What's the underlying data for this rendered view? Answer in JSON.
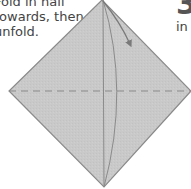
{
  "instructions": {
    "lines": [
      "Fold in half",
      "towards, then",
      "unfold."
    ]
  },
  "next_step": {
    "number": "3",
    "text_start": "in"
  },
  "figure": {
    "fill_color": "#c8c8c8",
    "edge_color": "#8a8a8a",
    "fold_line_color": "#7a7a7a",
    "dashed_line_color": "#8a8a8a"
  }
}
